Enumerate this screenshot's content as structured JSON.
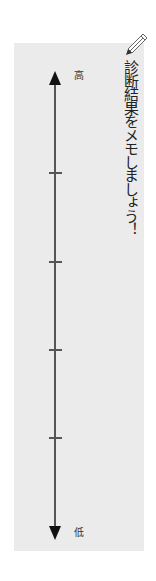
{
  "memo": {
    "title": "診断結果をメモしましょう！",
    "icon": "pencil-icon"
  },
  "scale": {
    "top_label": "高",
    "bottom_label": "低",
    "tick_count": 4
  },
  "colors": {
    "panel_bg": "#ebebeb",
    "line": "#555555",
    "arrow": "#111111",
    "text": "#333333"
  }
}
